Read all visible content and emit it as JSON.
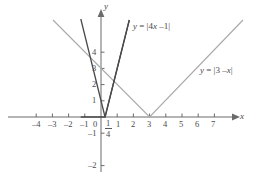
{
  "figure": {
    "type": "cartesian-graph",
    "background": "#ffffff",
    "axis_color": "#6b6b6b",
    "curve_colors": {
      "dark": "#4a4a4a",
      "gray": "#a8a8a8"
    },
    "origin_px": [
      101,
      117
    ],
    "unit_px": 16.2,
    "axis_labels": {
      "x": "x",
      "y": "y"
    },
    "x_ticks": [
      {
        "value": -4,
        "label": "–4"
      },
      {
        "value": -3,
        "label": "–3"
      },
      {
        "value": -2,
        "label": "–2"
      },
      {
        "value": -1,
        "label": "–1"
      },
      {
        "value": 0,
        "label": "0"
      },
      {
        "value": 1,
        "label": "1"
      },
      {
        "value": 2,
        "label": "2"
      },
      {
        "value": 3,
        "label": "3"
      },
      {
        "value": 4,
        "label": "4"
      },
      {
        "value": 5,
        "label": "5"
      },
      {
        "value": 6,
        "label": "6"
      },
      {
        "value": 7,
        "label": "7"
      }
    ],
    "x_special_tick": {
      "value": 0.25,
      "numerator": "1",
      "denominator": "4"
    },
    "y_ticks": [
      {
        "value": 4,
        "label": "4"
      },
      {
        "value": 3,
        "label": "3"
      },
      {
        "value": 2,
        "label": "2"
      },
      {
        "value": 1,
        "label": "1"
      },
      {
        "value": -1,
        "label": "–1"
      },
      {
        "value": -2,
        "label": "–2"
      }
    ],
    "curves": [
      {
        "id": "abs-4x-minus-1",
        "label_html": "<i>y</i> = |4<i>x</i> –1|",
        "color": "dark",
        "vertex": [
          0.25,
          0
        ],
        "slope_left": -4,
        "slope_right": 4
      },
      {
        "id": "abs-3-minus-x",
        "label_html": "<i>y</i> = |3 –<i>x</i>|",
        "color": "gray",
        "vertex": [
          3,
          0
        ],
        "slope_left": -1,
        "slope_right": 1
      }
    ]
  }
}
